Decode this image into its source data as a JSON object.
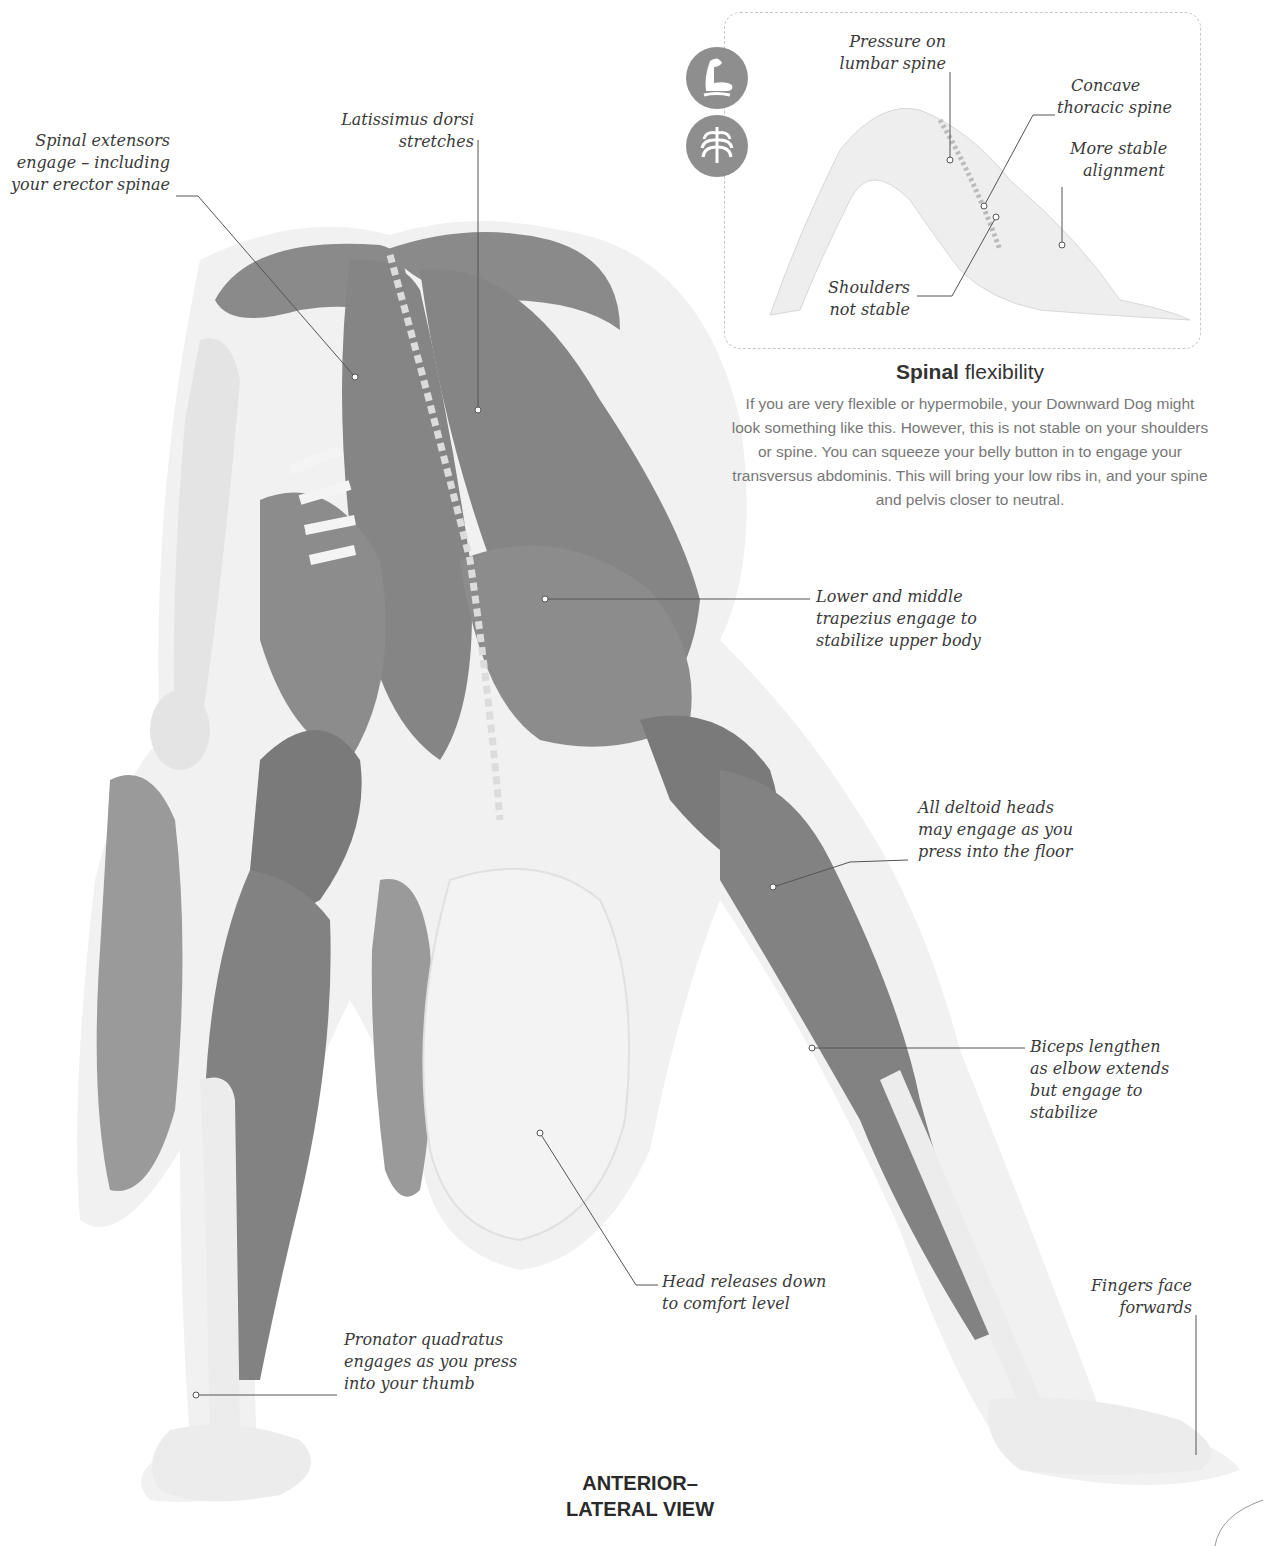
{
  "colors": {
    "muscle": "#8a8a8a",
    "muscle_dark": "#6e6e6e",
    "bone": "#ececec",
    "halo": "#f0f0f0",
    "text": "#3a3a3a",
    "body_text": "#777777",
    "icon_bg": "#8e8e8e",
    "leader_line": "#555555"
  },
  "main_view": {
    "label_line1": "ANTERIOR–",
    "label_line2": "LATERAL VIEW"
  },
  "callouts": {
    "spinal_extensors": [
      "Spinal extensors",
      "engage – including",
      "your erector spinae"
    ],
    "latissimus": [
      "Latissimus dorsi",
      "stretches"
    ],
    "trapezius": [
      "Lower and middle",
      "trapezius engage to",
      "stabilize upper body"
    ],
    "deltoid": [
      "All deltoid heads",
      "may engage as you",
      "press into the floor"
    ],
    "biceps": [
      "Biceps lengthen",
      "as elbow extends",
      "but engage to",
      "stabilize"
    ],
    "head": [
      "Head releases down",
      "to comfort level"
    ],
    "fingers": [
      "Fingers face",
      "forwards"
    ],
    "pronator": [
      "Pronator quadratus",
      "engages as you press",
      "into your thumb"
    ]
  },
  "inset": {
    "icons": [
      "flexed-arm-icon",
      "ribcage-icon"
    ],
    "callouts": {
      "lumbar": [
        "Pressure on",
        "lumbar spine"
      ],
      "thoracic": [
        "Concave",
        "thoracic spine"
      ],
      "alignment": [
        "More stable",
        "alignment"
      ],
      "shoulders": [
        "Shoulders",
        "not stable"
      ]
    },
    "title_bold": "Spinal",
    "title_rest": " flexibility",
    "body": "If you are very flexible or hypermobile, your Downward Dog might look something like this. However, this is not stable on your shoulders or spine. You can squeeze your belly button in to engage your transversus abdominis. This will bring your low ribs in, and your spine and pelvis closer to neutral."
  }
}
